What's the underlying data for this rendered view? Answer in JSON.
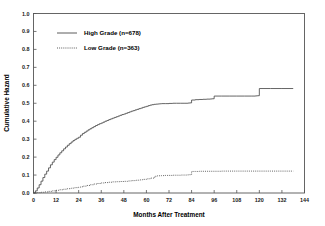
{
  "chart_data": {
    "type": "line",
    "title": "",
    "xlabel": "Months After Treatment",
    "ylabel": "Cumulative Hazard",
    "xlim": [
      0,
      144
    ],
    "ylim": [
      0.0,
      1.0
    ],
    "grid": false,
    "legend_position": "upper-left",
    "xticks": [
      0,
      12,
      24,
      36,
      48,
      60,
      72,
      84,
      96,
      108,
      120,
      132,
      144
    ],
    "xtick_labels": [
      "0",
      "12",
      "24",
      "36",
      "48",
      "60",
      "72",
      "84",
      "96",
      "108",
      "120",
      "132",
      "144"
    ],
    "yticks": [
      0.0,
      0.1,
      0.2,
      0.3,
      0.4,
      0.5,
      0.6,
      0.7,
      0.8,
      0.9,
      1.0
    ],
    "ytick_labels": [
      "0.0",
      "0.1",
      "0.2",
      "0.3",
      "0.4",
      "0.5",
      "0.6",
      "0.7",
      "0.8",
      "0.9",
      "1.0"
    ],
    "series": [
      {
        "name": "High Grade (n=678)",
        "label": "High Grade (n=678)",
        "style": "solid",
        "color": "#4a4a4a",
        "n": 678,
        "x": [
          0,
          1,
          2,
          3,
          4,
          5,
          6,
          7,
          8,
          9,
          10,
          11,
          12,
          13,
          14,
          15,
          16,
          17,
          18,
          19,
          20,
          21,
          22,
          23,
          24,
          25,
          26,
          27,
          28,
          29,
          30,
          31,
          32,
          33,
          34,
          35,
          36,
          37,
          38,
          39,
          40,
          41,
          42,
          43,
          44,
          45,
          46,
          47,
          48,
          49,
          50,
          51,
          52,
          53,
          54,
          55,
          56,
          57,
          58,
          59,
          60,
          61,
          62,
          63,
          64,
          65,
          66,
          67,
          68,
          70,
          72,
          74,
          76,
          78,
          80,
          82,
          83,
          84,
          86,
          88,
          90,
          92,
          94,
          95,
          96,
          100,
          104,
          108,
          112,
          116,
          118,
          119,
          120,
          126,
          132,
          138
        ],
        "y": [
          0.0,
          0.012,
          0.028,
          0.046,
          0.066,
          0.086,
          0.105,
          0.122,
          0.14,
          0.157,
          0.172,
          0.186,
          0.199,
          0.212,
          0.224,
          0.235,
          0.246,
          0.256,
          0.266,
          0.275,
          0.284,
          0.292,
          0.299,
          0.305,
          0.311,
          0.322,
          0.331,
          0.338,
          0.345,
          0.352,
          0.358,
          0.364,
          0.37,
          0.376,
          0.381,
          0.386,
          0.39,
          0.395,
          0.4,
          0.404,
          0.409,
          0.413,
          0.417,
          0.421,
          0.425,
          0.429,
          0.433,
          0.437,
          0.44,
          0.444,
          0.448,
          0.452,
          0.456,
          0.459,
          0.463,
          0.466,
          0.47,
          0.473,
          0.477,
          0.48,
          0.483,
          0.487,
          0.49,
          0.492,
          0.494,
          0.495,
          0.496,
          0.497,
          0.498,
          0.498,
          0.499,
          0.5,
          0.5,
          0.5,
          0.5,
          0.501,
          0.502,
          0.518,
          0.52,
          0.521,
          0.522,
          0.523,
          0.524,
          0.525,
          0.54,
          0.54,
          0.54,
          0.54,
          0.54,
          0.54,
          0.541,
          0.542,
          0.582,
          0.582,
          0.582,
          0.582
        ]
      },
      {
        "name": "Low Grade (n=363)",
        "label": "Low Grade (n=363)",
        "style": "dotted",
        "color": "#4a4a4a",
        "n": 363,
        "x": [
          0,
          2,
          4,
          6,
          8,
          10,
          12,
          14,
          16,
          18,
          20,
          22,
          24,
          26,
          28,
          30,
          32,
          34,
          36,
          38,
          40,
          42,
          44,
          46,
          48,
          50,
          52,
          54,
          56,
          58,
          60,
          62,
          64,
          65,
          66,
          68,
          70,
          72,
          74,
          76,
          78,
          80,
          82,
          83,
          84,
          86,
          88,
          92,
          96,
          100,
          104,
          108,
          112,
          116,
          120,
          126,
          132,
          138
        ],
        "y": [
          0.0,
          0.002,
          0.004,
          0.006,
          0.009,
          0.012,
          0.015,
          0.018,
          0.021,
          0.024,
          0.027,
          0.03,
          0.033,
          0.038,
          0.042,
          0.046,
          0.05,
          0.053,
          0.056,
          0.058,
          0.06,
          0.062,
          0.063,
          0.064,
          0.065,
          0.067,
          0.069,
          0.071,
          0.073,
          0.076,
          0.079,
          0.083,
          0.088,
          0.095,
          0.096,
          0.097,
          0.098,
          0.098,
          0.099,
          0.099,
          0.1,
          0.1,
          0.101,
          0.102,
          0.12,
          0.12,
          0.121,
          0.121,
          0.121,
          0.122,
          0.122,
          0.122,
          0.122,
          0.122,
          0.122,
          0.122,
          0.122,
          0.122
        ]
      }
    ],
    "legend": [
      {
        "label": "High Grade (n=678)",
        "style": "solid"
      },
      {
        "label": "Low Grade (n=363)",
        "style": "dotted"
      }
    ]
  }
}
